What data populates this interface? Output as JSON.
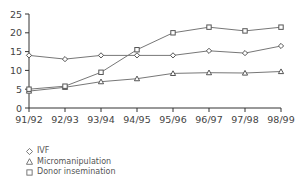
{
  "chart_data": {
    "type": "line",
    "title": "",
    "xlabel": "",
    "ylabel": "",
    "categories": [
      "91/92",
      "92/93",
      "93/94",
      "94/95",
      "95/96",
      "96/97",
      "97/98",
      "98/99"
    ],
    "ylim": [
      0,
      25
    ],
    "yticks": [
      0,
      5,
      10,
      15,
      20,
      25
    ],
    "grid": false,
    "legend_position": "bottom-left",
    "series": [
      {
        "name": "IVF",
        "marker": "diamond",
        "values": [
          14,
          13,
          14,
          14,
          14,
          15.2,
          14.6,
          16.5
        ]
      },
      {
        "name": "Micromanipulation",
        "marker": "triangle",
        "values": [
          4.5,
          5.5,
          7,
          7.8,
          9.2,
          9.4,
          9.3,
          9.7
        ]
      },
      {
        "name": "Donor insemination",
        "marker": "square",
        "values": [
          5,
          5.8,
          9.5,
          15.5,
          20,
          21.5,
          20.5,
          21.5
        ]
      }
    ]
  },
  "legend": {
    "items": [
      {
        "label": "IVF",
        "marker": "diamond"
      },
      {
        "label": "Micromanipulation",
        "marker": "triangle"
      },
      {
        "label": "Donor insemination",
        "marker": "square"
      }
    ]
  },
  "colors": {
    "line": "#777777",
    "axis": "#333333"
  }
}
